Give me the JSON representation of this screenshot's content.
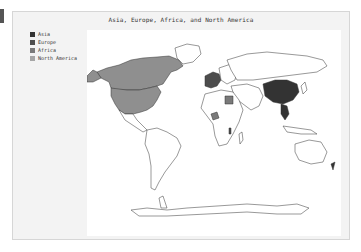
{
  "map": {
    "title": "Asia, Europe, Africa, and North America",
    "projection": "world (Robinson-like)",
    "legend": [
      {
        "label": "Asia",
        "color": "#333333"
      },
      {
        "label": "Europe",
        "color": "#4d4d4d"
      },
      {
        "label": "Africa",
        "color": "#7a7a7a"
      },
      {
        "label": "North America",
        "color": "#a6a6a6"
      }
    ],
    "highlighted_regions": [
      {
        "name": "Canada",
        "group": "North America"
      },
      {
        "name": "United States",
        "group": "North America"
      },
      {
        "name": "China",
        "group": "Asia"
      },
      {
        "name": "Southeast Asia",
        "group": "Asia"
      },
      {
        "name": "Western Europe",
        "group": "Europe"
      },
      {
        "name": "Egypt",
        "group": "Africa"
      },
      {
        "name": "Nigeria",
        "group": "Africa"
      },
      {
        "name": "Sierra Leone",
        "group": "Africa"
      },
      {
        "name": "Malawi",
        "group": "Africa"
      }
    ],
    "colors": {
      "land_unselected": "#ffffff",
      "border": "#333333",
      "ocean": "#ffffff",
      "panel_bg": "#f3f3f3"
    }
  }
}
